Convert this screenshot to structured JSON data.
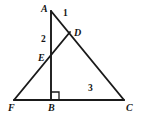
{
  "figure": {
    "kind": "geometry-diagram",
    "stroke_color": "#1a1a1a",
    "background_color": "#ffffff",
    "width": 141,
    "height": 122,
    "vertex_labels": [
      {
        "name": "A",
        "text": "A",
        "x": 41,
        "y": 4
      },
      {
        "name": "D",
        "text": "D",
        "x": 74,
        "y": 28
      },
      {
        "name": "E",
        "text": "E",
        "x": 38,
        "y": 53
      },
      {
        "name": "F",
        "text": "F",
        "x": 8,
        "y": 103
      },
      {
        "name": "B",
        "text": "B",
        "x": 48,
        "y": 103
      },
      {
        "name": "C",
        "text": "C",
        "x": 126,
        "y": 103
      }
    ],
    "angle_labels": [
      {
        "name": "angle-1",
        "text": "1",
        "x": 63,
        "y": 9
      },
      {
        "name": "angle-2",
        "text": "2",
        "x": 41,
        "y": 35
      },
      {
        "name": "angle-3",
        "text": "3",
        "x": 88,
        "y": 84
      }
    ],
    "points": {
      "A": {
        "x": 51,
        "y": 11
      },
      "D": {
        "x": 70,
        "y": 32
      },
      "E": {
        "x": 51,
        "y": 59
      },
      "F": {
        "x": 14,
        "y": 100
      },
      "B": {
        "x": 51,
        "y": 100
      },
      "C": {
        "x": 124,
        "y": 100
      }
    },
    "segments": [
      {
        "name": "segment-FC",
        "from": "F",
        "to": "C"
      },
      {
        "name": "segment-AB",
        "from": "A",
        "to": "B"
      },
      {
        "name": "segment-AC",
        "from": "A",
        "to": "C"
      },
      {
        "name": "segment-FD",
        "from": "F",
        "to": "D"
      }
    ],
    "right_angle": {
      "name": "right-angle-at-B",
      "at": "B",
      "size": 7
    }
  }
}
